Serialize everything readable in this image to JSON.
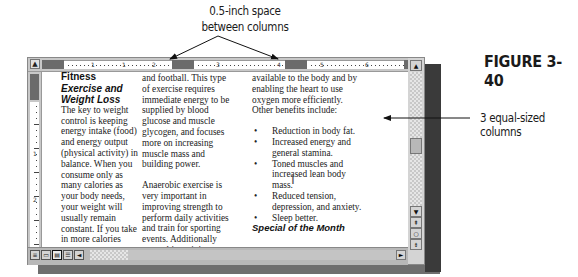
{
  "annotations": {
    "space_callout_line1": "0.5-inch space",
    "space_callout_line2": "between columns",
    "figure_label": "FIGURE 3-40",
    "columns_callout": "3 equal-sized columns"
  },
  "ruler": {
    "numbers": [
      "1",
      "1",
      "2",
      "3",
      "4",
      "5",
      "6"
    ],
    "vertical_numbers": [
      "1",
      "2"
    ]
  },
  "document": {
    "column1": {
      "heading": "Fitness",
      "subheading": "Exercise and Weight Loss",
      "body": "The key to weight control is keeping energy intake (food) and energy output (physical activity) in balance. When you consume only as many calories as your body needs, your weight will usually remain constant. If you take in more calories"
    },
    "column2": {
      "para1": "and football. This type of exercise requires immediate energy to be supplied by blood glucose and muscle glycogen, and focuses more on increasing muscle mass and building power.",
      "para2": "Anaerobic exercise is very important in improving strength to perform daily activities and train for sporting events. Additionally anaerobic activity increases your metabolic rate for several"
    },
    "column3": {
      "para1": "available to the body and by enabling the heart to use oxygen more efficiently. Other benefits include:",
      "bullets": [
        "Reduction in body fat.",
        "Increased energy and general stamina.",
        "Toned muscles and increased lean body mass.",
        "Reduced tension, depression, and anxiety.",
        "Sleep better."
      ],
      "next_heading": "Special of the Month"
    }
  },
  "icons": {
    "tab_selector": "▲",
    "scroll_up": "▲",
    "scroll_down": "▼",
    "prev_page": "⇞",
    "select_browse": "○",
    "next_page": "⇟",
    "scroll_right": "►",
    "view_normal": "≡",
    "view_web": "▭",
    "view_print": "▤",
    "view_outline": "☰",
    "scroll_left": "◄",
    "ibeam": "I"
  }
}
